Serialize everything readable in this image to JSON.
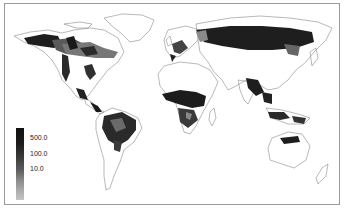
{
  "map": {
    "type": "world-choropleth-greyscale",
    "colors": {
      "frame": "#9a9a9a",
      "coast": "#8a8a8a",
      "high": "#1a1a1a",
      "mid": "#555555",
      "low": "#9a9a9a",
      "background": "#ffffff"
    }
  },
  "legend": {
    "labels": [
      {
        "value": "500.0"
      },
      {
        "value": "100.0"
      },
      {
        "value": "10.0"
      }
    ]
  }
}
